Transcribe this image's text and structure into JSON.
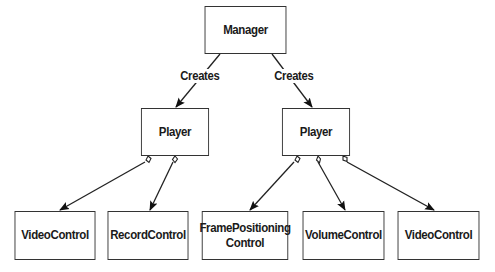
{
  "nodes": {
    "manager": {
      "label": "Manager"
    },
    "player_left": {
      "label": "Player"
    },
    "player_right": {
      "label": "Player"
    },
    "video_control_left": {
      "label": "VideoControl"
    },
    "record_control": {
      "label": "RecordControl"
    },
    "frame_positioning_control": {
      "label": "FramePositioning Control"
    },
    "volume_control": {
      "label": "VolumeControl"
    },
    "video_control_right": {
      "label": "VideoControl"
    }
  },
  "edges": [
    {
      "from": "manager",
      "to": "player_left",
      "label": "Creates",
      "type": "arrow"
    },
    {
      "from": "manager",
      "to": "player_right",
      "label": "Creates",
      "type": "arrow"
    },
    {
      "from": "player_left",
      "to": "video_control_left",
      "type": "aggregation"
    },
    {
      "from": "player_left",
      "to": "record_control",
      "type": "aggregation"
    },
    {
      "from": "player_right",
      "to": "frame_positioning_control",
      "type": "aggregation"
    },
    {
      "from": "player_right",
      "to": "volume_control",
      "type": "aggregation"
    },
    {
      "from": "player_right",
      "to": "video_control_right",
      "type": "aggregation"
    }
  ],
  "edge_labels": {
    "creates_left": "Creates",
    "creates_right": "Creates"
  }
}
